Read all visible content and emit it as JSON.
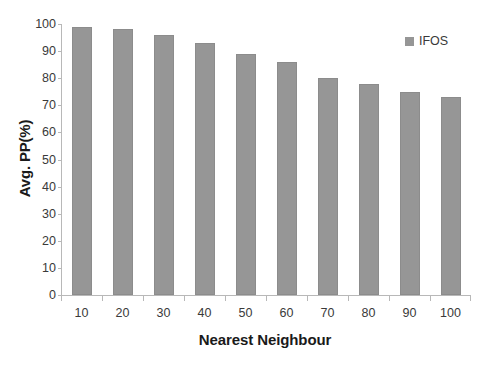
{
  "chart_data": {
    "type": "bar",
    "title": "",
    "subtitle": "",
    "xlabel": "Nearest Neighbour",
    "ylabel": "Avg. PP(%)",
    "categories": [
      "10",
      "20",
      "30",
      "40",
      "50",
      "60",
      "70",
      "80",
      "90",
      "100"
    ],
    "series": [
      {
        "name": "IFOS",
        "color": "#969696",
        "values": [
          99,
          98,
          96,
          93,
          89,
          86,
          80,
          78,
          75,
          73
        ]
      }
    ],
    "ylim": [
      0,
      100
    ],
    "ytick_step": 10,
    "yticks": [
      "100",
      "90",
      "80",
      "70",
      "60",
      "50",
      "40",
      "30",
      "20",
      "10",
      "0"
    ],
    "grid": false,
    "legend": {
      "position": "top-right",
      "entries": [
        {
          "label": "IFOS",
          "color": "#969696",
          "marker": "square-swatch"
        }
      ]
    },
    "axis_color": "#b8b8b8",
    "background": "#ffffff"
  }
}
